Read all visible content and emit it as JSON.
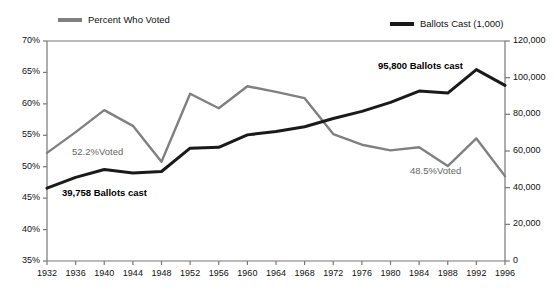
{
  "title": "",
  "legend": {
    "voted": {
      "label": "Percent Who Voted",
      "color": "#808080"
    },
    "ballots": {
      "label": "Ballots Cast (1,000)",
      "color": "#1a1a1a"
    }
  },
  "axes": {
    "y_left": {
      "ticks": [
        "70%",
        "65%",
        "60%",
        "55%",
        "50%",
        "45%",
        "40%",
        "35%"
      ],
      "min": 35,
      "max": 70,
      "step": 5
    },
    "y_right": {
      "ticks": [
        "120,000",
        "100,000",
        "80,000",
        "60,000",
        "40,000",
        "20,000",
        "0"
      ],
      "min": 0,
      "max": 120000,
      "step": 20000
    },
    "x": {
      "ticks": [
        "1932",
        "1936",
        "1940",
        "1944",
        "1948",
        "1952",
        "1956",
        "1960",
        "1964",
        "1968",
        "1972",
        "1976",
        "1980",
        "1984",
        "1988",
        "1992",
        "1996"
      ]
    }
  },
  "annotations": [
    {
      "name": "voted-start-label",
      "text": "52.2%Voted",
      "style": "gray",
      "x": 72,
      "y": 146
    },
    {
      "name": "ballots-start-label",
      "text": "39,758 Ballots cast",
      "style": "black",
      "x": 62,
      "y": 187
    },
    {
      "name": "ballots-end-label",
      "text": "95,800 Ballots cast",
      "style": "black",
      "x": 378,
      "y": 60
    },
    {
      "name": "voted-end-label",
      "text": "48.5%Voted",
      "style": "gray",
      "x": 410,
      "y": 165
    }
  ],
  "chart_data": {
    "type": "line",
    "title": "",
    "xlabel": "",
    "ylabel": "",
    "grid": false,
    "legend_position": "top",
    "x": [
      1932,
      1936,
      1940,
      1944,
      1948,
      1952,
      1956,
      1960,
      1964,
      1968,
      1972,
      1976,
      1980,
      1984,
      1988,
      1992,
      1996
    ],
    "series": [
      {
        "name": "Percent Who Voted",
        "axis": "left",
        "ylim": [
          35,
          70
        ],
        "color": "#808080",
        "values": [
          52.2,
          55.5,
          59.0,
          56.5,
          50.8,
          61.6,
          59.3,
          62.8,
          61.9,
          60.9,
          55.2,
          53.5,
          52.6,
          53.1,
          50.1,
          54.5,
          48.5
        ]
      },
      {
        "name": "Ballots Cast (1,000)",
        "axis": "right",
        "ylim": [
          0,
          120000
        ],
        "color": "#1a1a1a",
        "values": [
          39758,
          45600,
          49900,
          48000,
          48800,
          61550,
          62000,
          68800,
          70600,
          73200,
          77700,
          81600,
          86500,
          92700,
          91600,
          104400,
          95800
        ]
      }
    ]
  }
}
